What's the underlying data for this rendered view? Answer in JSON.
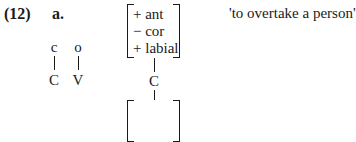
{
  "example": {
    "number": "(12)",
    "sublabel": "a.",
    "gloss": "'to overtake a person'"
  },
  "left_structure": {
    "melody": [
      "c",
      "o"
    ],
    "skeleton": [
      "C",
      "V"
    ]
  },
  "right_structure": {
    "features": [
      "+ ant",
      "− cor",
      "+ labial"
    ],
    "skeleton": "C",
    "lower_matrix": []
  }
}
